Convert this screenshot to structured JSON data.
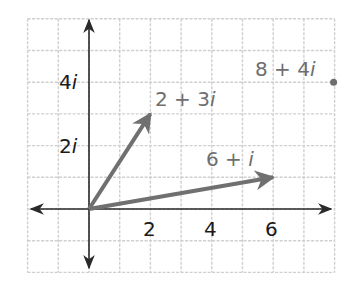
{
  "diagram": {
    "type": "complex-plane",
    "colors": {
      "grid": "#cfcfcf",
      "axis": "#2a2a2a",
      "vector": "#707070",
      "point": "#6e6e6e",
      "axis_label": "#1a1a1a",
      "vector_label": "#6e6e6e"
    },
    "axes": {
      "real_ticks": [
        {
          "value": 2,
          "label": "2"
        },
        {
          "value": 4,
          "label": "4"
        },
        {
          "value": 6,
          "label": "6"
        }
      ],
      "imag_ticks": [
        {
          "value": 2,
          "label_num": "2",
          "label_unit": "i"
        },
        {
          "value": 4,
          "label_num": "4",
          "label_unit": "i"
        }
      ]
    },
    "vectors": [
      {
        "re": 2,
        "im": 3,
        "label_re": "2",
        "label_op": "+",
        "label_im": "3",
        "label_unit": "i"
      },
      {
        "re": 6,
        "im": 1,
        "label_re": "6",
        "label_op": "+",
        "label_im": "",
        "label_unit": "i"
      }
    ],
    "points": [
      {
        "re": 8,
        "im": 4,
        "label_re": "8",
        "label_op": "+",
        "label_im": "4",
        "label_unit": "i"
      }
    ]
  }
}
